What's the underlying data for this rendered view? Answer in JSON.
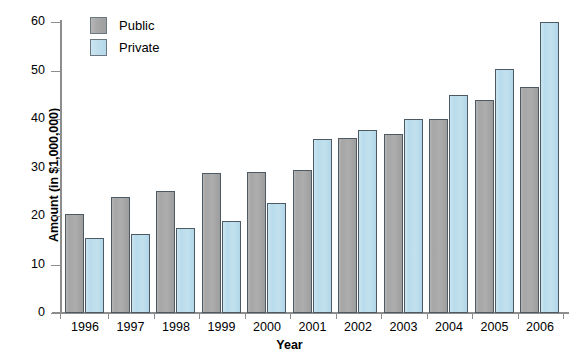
{
  "chart_data": {
    "type": "bar",
    "title": "",
    "xlabel": "Year",
    "ylabel": "Amount (in $1,000,000)",
    "categories": [
      "1996",
      "1997",
      "1998",
      "1999",
      "2000",
      "2001",
      "2002",
      "2003",
      "2004",
      "2005",
      "2006"
    ],
    "series": [
      {
        "name": "Public",
        "color": "#a8a8a8",
        "values": [
          20.5,
          24.0,
          25.2,
          28.8,
          29.0,
          29.5,
          36.0,
          37.0,
          40.0,
          44.0,
          46.5
        ]
      },
      {
        "name": "Private",
        "color": "#bfdeed",
        "values": [
          15.4,
          16.2,
          17.5,
          19.0,
          22.7,
          35.8,
          37.7,
          40.0,
          45.0,
          50.3,
          60.0
        ]
      }
    ],
    "ylim": [
      0,
      60
    ],
    "yticks": [
      0,
      10,
      20,
      30,
      40,
      50,
      60
    ],
    "ytick_labels": [
      "0",
      "10",
      "20",
      "30",
      "40",
      "50",
      "60"
    ],
    "grid": false,
    "legend_position": "top-left",
    "legend": [
      "Public",
      "Private"
    ]
  },
  "axis": {
    "y_title": "Amount (in $1,000,000)",
    "x_title": "Year"
  }
}
